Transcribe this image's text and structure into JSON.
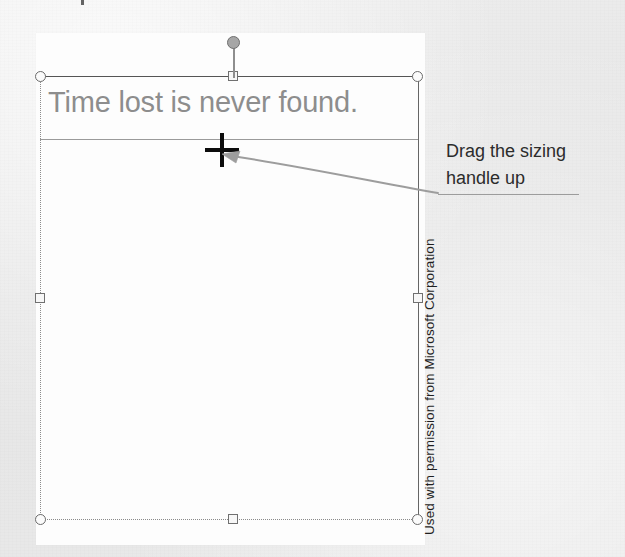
{
  "figure": {
    "caption_credit": "Used with permission from Microsoft Corporation"
  },
  "slide": {
    "title_placeholder": {
      "text": "Time lost is never found.",
      "text_color": "#8d8d8d",
      "state": "selected"
    },
    "body_placeholder": {
      "text": "",
      "state": "empty"
    },
    "background_color": "#fdfdfd"
  },
  "selection": {
    "handles": [
      {
        "name": "handle-top-left",
        "shape": "circle",
        "x": 40,
        "y": 76
      },
      {
        "name": "handle-top-center",
        "shape": "square",
        "x": 228,
        "y": 71
      },
      {
        "name": "handle-top-right",
        "shape": "circle",
        "x": 413,
        "y": 76
      },
      {
        "name": "handle-middle-left",
        "shape": "square",
        "x": 35,
        "y": 293
      },
      {
        "name": "handle-middle-right",
        "shape": "square",
        "x": 413,
        "y": 293
      },
      {
        "name": "handle-bottom-left",
        "shape": "circle",
        "x": 40,
        "y": 514
      },
      {
        "name": "handle-bottom-center",
        "shape": "square",
        "x": 228,
        "y": 514
      },
      {
        "name": "handle-bottom-right",
        "shape": "circle",
        "x": 413,
        "y": 514
      }
    ],
    "rotation_handle": {
      "name": "rotation-handle",
      "shape": "circle-on-stem",
      "x": 233,
      "y": 42
    },
    "border_color": "#6b6b6b"
  },
  "cursor": {
    "type": "crosshair",
    "icon": "crosshair-cursor",
    "x": 222,
    "y": 150,
    "color": "#0c0c0c"
  },
  "annotation": {
    "arrow": {
      "icon": "arrow-left-icon",
      "color": "#9d9d9d",
      "from_x": 438,
      "from_y": 193,
      "to_x": 224,
      "to_y": 155
    },
    "callout_lines": [
      "Drag the sizing",
      "handle up"
    ],
    "callout_color": "#2c2c2c",
    "underline_color": "#9c9c9c"
  },
  "page": {
    "background_color": "#e8e8e8"
  }
}
